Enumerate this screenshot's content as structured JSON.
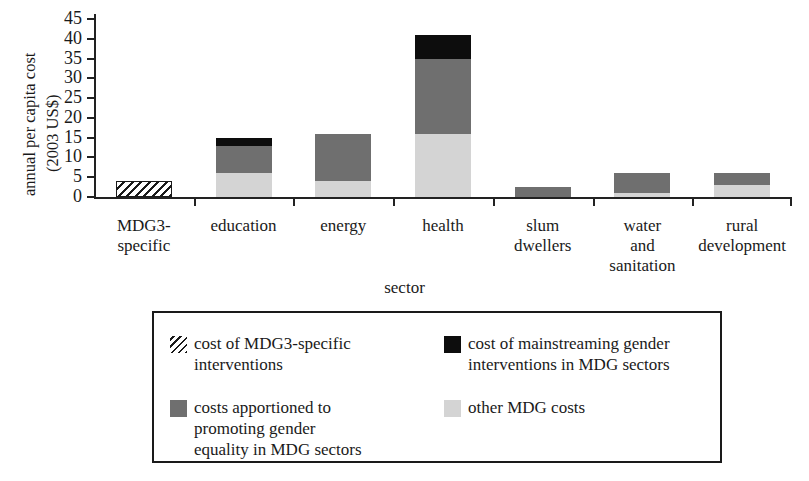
{
  "chart_data": {
    "type": "bar",
    "stacked": true,
    "title": "",
    "xlabel": "sector",
    "ylabel": "annual per capita cost (2003 US$)",
    "ylabel_lines": [
      "annual per capita cost",
      "(2003 US$)"
    ],
    "ylim": [
      0,
      45
    ],
    "yticks": [
      0,
      5,
      10,
      15,
      20,
      25,
      30,
      35,
      40,
      45
    ],
    "grid": false,
    "legend_position": "below-plot",
    "categories": [
      "MDG3-specific",
      "education",
      "energy",
      "health",
      "slum dwellers",
      "water and sanitation",
      "rural development"
    ],
    "category_label_lines": [
      [
        "MDG3-",
        "specific"
      ],
      [
        "education"
      ],
      [
        "energy"
      ],
      [
        "health"
      ],
      [
        "slum",
        "dwellers"
      ],
      [
        "water",
        "and",
        "sanitation"
      ],
      [
        "rural",
        "development"
      ]
    ],
    "series": [
      {
        "name": "cost of MDG3-specific interventions",
        "key": "mdg3",
        "color": "#1a1a1a",
        "pattern": "diagonal-hatch",
        "values": [
          4,
          0,
          0,
          0,
          0,
          0,
          0
        ]
      },
      {
        "name": "other MDG costs",
        "key": "other",
        "color": "#d4d4d4",
        "pattern": "solid",
        "values": [
          0,
          6,
          4,
          16,
          0,
          1,
          3
        ]
      },
      {
        "name": "costs apportioned to promoting gender equality in MDG sectors",
        "key": "gender",
        "color": "#6f6f6f",
        "pattern": "solid",
        "values": [
          0,
          7,
          12,
          19,
          2.5,
          5,
          3
        ]
      },
      {
        "name": "cost of mainstreaming gender interventions in MDG sectors",
        "key": "mainstreaming",
        "color": "#0d0d0d",
        "pattern": "solid",
        "values": [
          0,
          2,
          0,
          6,
          0,
          0,
          0
        ]
      }
    ],
    "totals": [
      4,
      15,
      16,
      41,
      2.5,
      6,
      6
    ]
  },
  "legend": {
    "items": [
      {
        "swatch": "hatch",
        "lines": [
          "cost of MDG3-specific",
          "interventions"
        ]
      },
      {
        "swatch": "black",
        "lines": [
          "cost of mainstreaming gender",
          "interventions in MDG sectors"
        ]
      },
      {
        "swatch": "dark",
        "lines": [
          "costs apportioned to",
          "promoting gender",
          "equality in MDG sectors"
        ]
      },
      {
        "swatch": "light",
        "lines": [
          "other MDG costs"
        ]
      }
    ]
  }
}
